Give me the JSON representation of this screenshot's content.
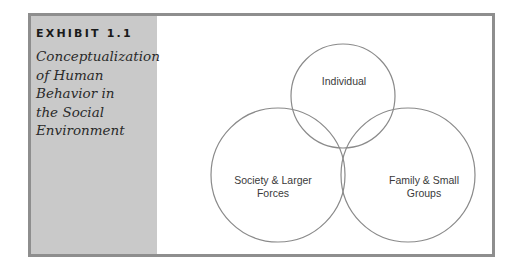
{
  "exhibit": {
    "label": "EXHIBIT 1.1",
    "title_lines": [
      "Conceptualization",
      "of Human",
      "Behavior in",
      "the Social",
      "Environment"
    ]
  },
  "diagram": {
    "type": "venn",
    "circles": [
      {
        "id": "individual",
        "label_lines": [
          "Individual"
        ]
      },
      {
        "id": "society",
        "label_lines": [
          "Society & Larger",
          "Forces"
        ]
      },
      {
        "id": "family",
        "label_lines": [
          "Family & Small",
          "Groups"
        ]
      }
    ],
    "colors": {
      "frame_border": "#8e8e8e",
      "sidebar_bg": "#c9c9c9",
      "circle_stroke": "#8a8a8a",
      "text": "#3a3a3a"
    }
  }
}
